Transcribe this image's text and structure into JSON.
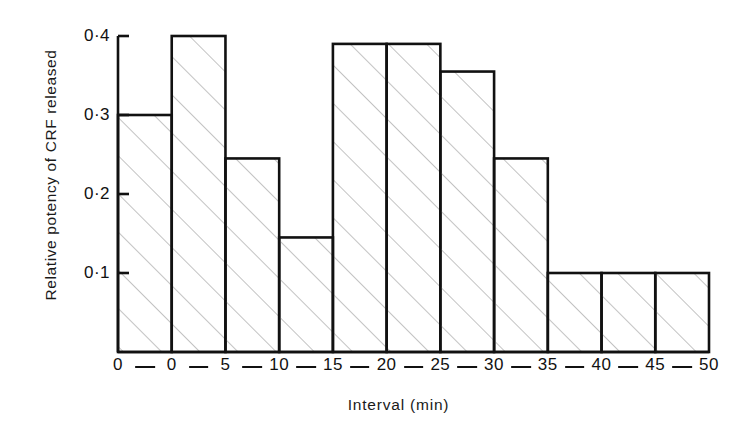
{
  "chart_data": {
    "type": "bar",
    "title": "",
    "subtitle": "",
    "xlabel": "Interval (min)",
    "ylabel": "Relative potency of CRF released",
    "categories": [
      "0-0",
      "0-5",
      "5-10",
      "10-15",
      "15-20",
      "20-25",
      "25-30",
      "30-35",
      "35-40",
      "40-45",
      "45-50"
    ],
    "values": [
      0.3,
      0.4,
      0.245,
      0.145,
      0.39,
      0.39,
      0.355,
      0.245,
      0.1,
      0.1,
      0.1
    ],
    "bin_edges": [
      "0",
      "0",
      "5",
      "10",
      "15",
      "20",
      "25",
      "30",
      "35",
      "40",
      "45",
      "50"
    ],
    "ylim": [
      0,
      0.4
    ],
    "xlim": [
      0,
      11
    ],
    "ytick_values": [
      0.1,
      0.2,
      0.3,
      0.4
    ],
    "ytick_labels": [
      "0·1",
      "0·2",
      "0·3",
      "0·4"
    ],
    "xtick_labels": [
      "0",
      "0",
      "5",
      "10",
      "15",
      "20",
      "25",
      "30",
      "35",
      "40",
      "45",
      "50"
    ],
    "xtick_separator": "—",
    "grid": false,
    "legend": null,
    "bar_fill": "hatched-diagonal",
    "colors": {
      "line": "#111111",
      "hatch": "#9a9a9a",
      "background": "#ffffff"
    }
  },
  "geometry": {
    "plot_left": 118,
    "plot_right": 709,
    "plot_bottom": 352,
    "plot_top": 36,
    "bar_count": 11
  }
}
